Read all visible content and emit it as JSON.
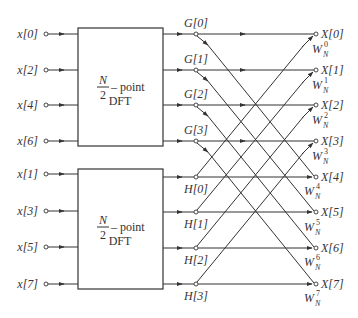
{
  "diagram": {
    "type": "Decimation-in-time FFT flow graph (8-point)",
    "inputs_even": [
      "x[0]",
      "x[2]",
      "x[4]",
      "x[6]"
    ],
    "inputs_odd": [
      "x[1]",
      "x[3]",
      "x[5]",
      "x[7]"
    ],
    "blocks": [
      {
        "numerator": "N",
        "denominator": "2",
        "label": "– point",
        "sublabel": "DFT"
      },
      {
        "numerator": "N",
        "denominator": "2",
        "label": "– point",
        "sublabel": "DFT"
      }
    ],
    "g_nodes": [
      "G[0]",
      "G[1]",
      "G[2]",
      "G[3]"
    ],
    "h_nodes": [
      "H[0]",
      "H[1]",
      "H[2]",
      "H[3]"
    ],
    "outputs": [
      "X[0]",
      "X[1]",
      "X[2]",
      "X[3]",
      "X[4]",
      "X[5]",
      "X[6]",
      "X[7]"
    ],
    "twiddles": [
      {
        "base": "W",
        "sub": "N",
        "sup": "0"
      },
      {
        "base": "W",
        "sub": "N",
        "sup": "1"
      },
      {
        "base": "W",
        "sub": "N",
        "sup": "2"
      },
      {
        "base": "W",
        "sub": "N",
        "sup": "3"
      },
      {
        "base": "W",
        "sub": "N",
        "sup": "4"
      },
      {
        "base": "W",
        "sub": "N",
        "sup": "5"
      },
      {
        "base": "W",
        "sub": "N",
        "sup": "6"
      },
      {
        "base": "W",
        "sub": "N",
        "sup": "7"
      }
    ],
    "colors": {
      "stroke": "#333333",
      "background": "#ffffff"
    }
  }
}
